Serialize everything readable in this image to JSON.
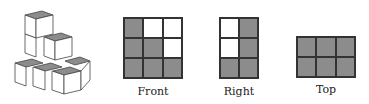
{
  "figure": {
    "iso_shape": {
      "description": "isometric stack of unit cubes"
    },
    "views": [
      {
        "label": "Front",
        "rows": 3,
        "cols": 3,
        "cells": [
          [
            1,
            0,
            0
          ],
          [
            1,
            1,
            0
          ],
          [
            1,
            1,
            1
          ]
        ]
      },
      {
        "label": "Right",
        "rows": 3,
        "cols": 2,
        "cells": [
          [
            0,
            1
          ],
          [
            0,
            1
          ],
          [
            1,
            1
          ]
        ]
      },
      {
        "label": "Top",
        "rows": 2,
        "cols": 3,
        "cells": [
          [
            1,
            1,
            1
          ],
          [
            1,
            1,
            1
          ]
        ]
      }
    ]
  },
  "colors": {
    "filled": "#8c8c8c",
    "empty": "#ffffff",
    "line": "#333333"
  }
}
